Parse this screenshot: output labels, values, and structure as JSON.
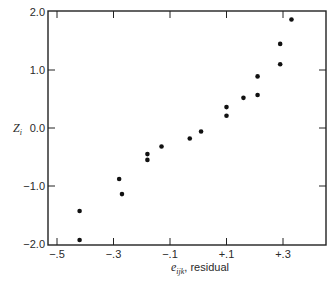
{
  "chart_data": {
    "type": "scatter",
    "title": "",
    "xlabel": "e_ijk , residual",
    "xlabel_parts": {
      "symbol": "e",
      "subscript": "ijk",
      "text": ", residual"
    },
    "ylabel": "Z_i",
    "ylabel_parts": {
      "symbol": "Z",
      "subscript": "i"
    },
    "xlim": [
      -0.535,
      0.45
    ],
    "ylim": [
      -2.0,
      2.0
    ],
    "x_ticks": [
      -0.5,
      -0.3,
      -0.1,
      0.1,
      0.3
    ],
    "x_tick_labels": [
      "−.5",
      "−.3",
      "−.1",
      "+.1",
      "+.3"
    ],
    "y_ticks": [
      2.0,
      1.0,
      0.0,
      -1.0,
      -2.0
    ],
    "y_tick_labels": [
      "2.0",
      "1.0",
      "0.0",
      "−1.0",
      "−2.0"
    ],
    "grid": false,
    "legend": null,
    "marker_color": "#111111",
    "points": [
      {
        "x": -0.42,
        "y": -1.93
      },
      {
        "x": -0.42,
        "y": -1.43
      },
      {
        "x": -0.27,
        "y": -1.14
      },
      {
        "x": -0.28,
        "y": -0.88
      },
      {
        "x": -0.18,
        "y": -0.55
      },
      {
        "x": -0.18,
        "y": -0.45
      },
      {
        "x": -0.13,
        "y": -0.32
      },
      {
        "x": -0.03,
        "y": -0.18
      },
      {
        "x": 0.01,
        "y": -0.06
      },
      {
        "x": 0.1,
        "y": 0.21
      },
      {
        "x": 0.1,
        "y": 0.36
      },
      {
        "x": 0.16,
        "y": 0.52
      },
      {
        "x": 0.21,
        "y": 0.57
      },
      {
        "x": 0.21,
        "y": 0.89
      },
      {
        "x": 0.29,
        "y": 1.1
      },
      {
        "x": 0.29,
        "y": 1.45
      },
      {
        "x": 0.33,
        "y": 1.87
      }
    ]
  }
}
